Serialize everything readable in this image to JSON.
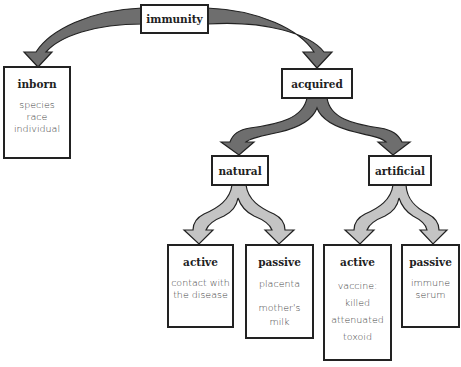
{
  "diagram": {
    "type": "tree",
    "root": {
      "label": "immunity"
    },
    "inborn": {
      "title": "inborn",
      "items": [
        "species",
        "race",
        "individual"
      ]
    },
    "acquired": {
      "label": "acquired"
    },
    "natural": {
      "label": "natural"
    },
    "artificial": {
      "label": "artificial"
    },
    "natural_active": {
      "title": "active",
      "items": [
        "contact with",
        "the disease"
      ]
    },
    "natural_passive": {
      "title": "passive",
      "items": [
        "placenta",
        "mother's milk"
      ]
    },
    "artificial_active": {
      "title": "active",
      "items": [
        "vaccine:",
        "killed",
        "attenuated",
        "toxoid"
      ]
    },
    "artificial_passive": {
      "title": "passive",
      "items": [
        "immune",
        "serum"
      ]
    },
    "colors": {
      "dark_arrow": "#6e6e6e",
      "light_arrow": "#c4c4c4",
      "border": "#222222"
    }
  }
}
